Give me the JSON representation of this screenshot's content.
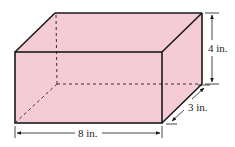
{
  "figure": {
    "type": "rectangular-prism",
    "fill_color": "#f5ccd5",
    "edge_color": "#1a1a1a",
    "hidden_edge_style": "dashed",
    "dimensions": {
      "length": {
        "label": "8 in.",
        "value": 8,
        "unit": "in."
      },
      "height": {
        "label": "4 in.",
        "value": 4,
        "unit": "in."
      },
      "depth": {
        "label": "3 in.",
        "value": 3,
        "unit": "in."
      }
    }
  }
}
